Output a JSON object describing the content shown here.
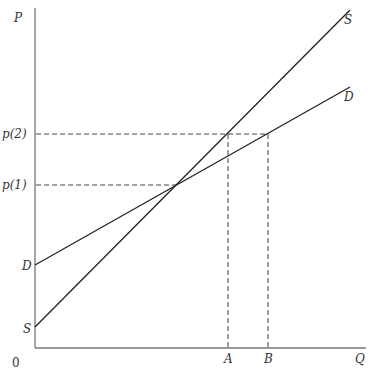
{
  "diagram": {
    "axes": {
      "y_label": "P",
      "x_label": "Q",
      "origin_label": "0"
    },
    "price_levels": [
      {
        "label": "p(2)",
        "y": 134
      },
      {
        "label": "p(1)",
        "y": 185
      }
    ],
    "quantities": [
      {
        "label": "A",
        "x": 228
      },
      {
        "label": "B",
        "x": 268
      }
    ],
    "curves": {
      "supply": {
        "label": "S",
        "intercept_label": "S"
      },
      "demand": {
        "label": "D",
        "intercept_label": "D"
      }
    },
    "colors": {
      "curve": "#222222",
      "axis": "#777777",
      "dashed": "#444444",
      "text": "#333333"
    }
  }
}
